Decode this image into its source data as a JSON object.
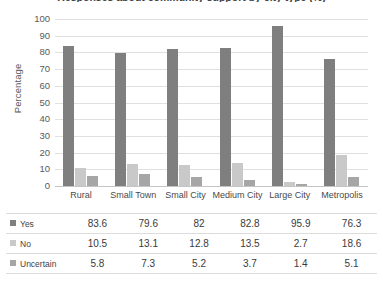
{
  "chart_data": {
    "type": "bar",
    "title": "Responses about community support by city type (%)",
    "xlabel": "",
    "ylabel": "Percentage",
    "ylim": [
      0,
      100
    ],
    "ytick_step": 10,
    "yticks": [
      100,
      90,
      80,
      70,
      60,
      50,
      40,
      30,
      20,
      10,
      0
    ],
    "grid": true,
    "legend_position": "table-below",
    "categories": [
      "Rural",
      "Small Town",
      "Small City",
      "Medium City",
      "Large City",
      "Metropolis"
    ],
    "series": [
      {
        "name": "Yes",
        "color": "#7f7f7f",
        "values": [
          83.6,
          79.6,
          82,
          82.8,
          95.9,
          76.3
        ]
      },
      {
        "name": "No",
        "color": "#c9c9c9",
        "values": [
          10.5,
          13.1,
          12.8,
          13.5,
          2.7,
          18.6
        ]
      },
      {
        "name": "Uncertain",
        "color": "#a6a6a6",
        "values": [
          5.8,
          7.3,
          5.2,
          3.7,
          1.4,
          5.1
        ]
      }
    ]
  },
  "table": {
    "row_labels": [
      "Yes",
      "No",
      "Uncertain"
    ],
    "column_headers": [
      "Rural",
      "Small Town",
      "Small City",
      "Medium City",
      "Large City",
      "Metropolis"
    ],
    "rows": [
      [
        "83.6",
        "79.6",
        "82",
        "82.8",
        "95.9",
        "76.3"
      ],
      [
        "10.5",
        "13.1",
        "12.8",
        "13.5",
        "2.7",
        "18.6"
      ],
      [
        "5.8",
        "7.3",
        "5.2",
        "3.7",
        "1.4",
        "5.1"
      ]
    ]
  }
}
